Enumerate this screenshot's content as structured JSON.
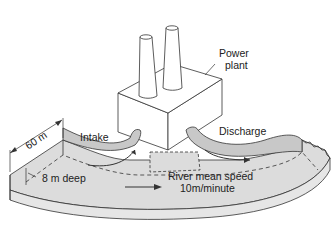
{
  "diagram": {
    "type": "illustration",
    "labels": {
      "power_plant_line1": "Power",
      "power_plant_line2": "plant",
      "intake": "Intake",
      "discharge": "Discharge",
      "width": "60 m",
      "depth": "8 m deep",
      "speed_line1": "River mean speed",
      "speed_line2": "10m/minute"
    },
    "colors": {
      "water_fill": "#dcdcdc",
      "pipe_fill": "#c8c8c8",
      "stroke": "#333333",
      "building_fill": "#ffffff"
    }
  }
}
